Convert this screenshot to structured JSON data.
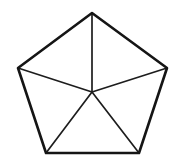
{
  "figure": {
    "name": "regular-pentagon-with-center-spokes",
    "background_color": "#ffffff",
    "outline_color": "#151515",
    "spoke_color": "#1d1d1d",
    "fill_color": "#ffffff",
    "outline_width": 2.6,
    "spoke_width": 1.7,
    "canvas": {
      "width": 175,
      "height": 165
    },
    "vertices": [
      {
        "label": "apex",
        "x": 92,
        "y": 13
      },
      {
        "label": "right",
        "x": 167,
        "y": 68
      },
      {
        "label": "bottom-right",
        "x": 139,
        "y": 153
      },
      {
        "label": "bottom-left",
        "x": 46,
        "y": 153
      },
      {
        "label": "left",
        "x": 18,
        "y": 68
      }
    ],
    "center": {
      "label": "center",
      "x": 92,
      "y": 92
    },
    "outline_path": "M 92 13 L 167 68 L 139 153 L 46 153 L 18 68 Z",
    "spokes": [
      {
        "name": "spoke-apex",
        "x1": 92,
        "y1": 92,
        "x2": 92,
        "y2": 13
      },
      {
        "name": "spoke-right",
        "x1": 92,
        "y1": 92,
        "x2": 167,
        "y2": 68
      },
      {
        "name": "spoke-bottom-right",
        "x1": 92,
        "y1": 92,
        "x2": 139,
        "y2": 153
      },
      {
        "name": "spoke-bottom-left",
        "x1": 92,
        "y1": 92,
        "x2": 46,
        "y2": 153
      },
      {
        "name": "spoke-left",
        "x1": 92,
        "y1": 92,
        "x2": 18,
        "y2": 68
      }
    ]
  }
}
